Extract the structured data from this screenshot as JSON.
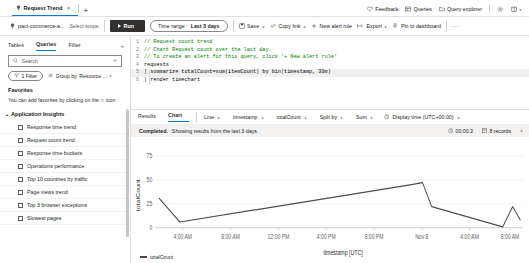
{
  "window": {
    "tab": {
      "title": "Request Trend",
      "close_label": "×",
      "new_tab_label": "+",
      "icon": "bulb-icon"
    }
  },
  "header": {
    "items": [
      {
        "label": "Feedback",
        "icon": "heart-icon"
      },
      {
        "label": "Queries",
        "icon": "queries-icon"
      },
      {
        "label": "Query explorer",
        "icon": "folder-icon"
      }
    ],
    "settings_icon": "gear-icon",
    "help_icon": "book-icon",
    "help_caret": "∨"
  },
  "command_bar": {
    "scope_resource": "pact-commerce-a...",
    "scope_select_label": "Select scope",
    "run_label": "Run",
    "time_range_prefix": "Time range :",
    "time_range_value": "Last 3 days",
    "save_label": "Save",
    "copy_link_label": "Copy link",
    "new_alert_rule_label": "New alert rule",
    "export_label": "Export",
    "pin_label": "Pin to dashboard",
    "overflow_label": "···",
    "caret": "∨"
  },
  "sidebar": {
    "tabs": [
      {
        "label": "Tables",
        "active": false
      },
      {
        "label": "Queries",
        "active": true
      },
      {
        "label": "Filter",
        "active": false
      }
    ],
    "collapse_icon": "«",
    "search": {
      "placeholder": "Search",
      "icon": "search-icon",
      "trailing_icon": "keyboard-icon"
    },
    "filter_pill": {
      "label": "1 Filter",
      "icon": "funnel-icon"
    },
    "group_by": {
      "label": "Group by: Resource ...",
      "icon": "list-icon",
      "caret": "∨"
    },
    "favorites": {
      "title": "Favorites",
      "description": "You can add favorites by clicking on the ☆ icon"
    },
    "group": {
      "name": "Application Insights",
      "chevron": "▴",
      "items": [
        {
          "label": "Response time trend"
        },
        {
          "label": "Request count trend"
        },
        {
          "label": "Response time buckets"
        },
        {
          "label": "Operations performance"
        },
        {
          "label": "Top 10 countries by traffic"
        },
        {
          "label": "Page views trend"
        },
        {
          "label": "Top 3 browser exceptions"
        },
        {
          "label": "Slowest pages"
        }
      ]
    }
  },
  "editor": {
    "lines": [
      {
        "num": "1",
        "text": "// Request count trend",
        "kind": "comment"
      },
      {
        "num": "2",
        "text": "// Chart Request count over the last day.",
        "kind": "comment"
      },
      {
        "num": "3",
        "text": "// To create an alert for this query, click '+ New alert rule'",
        "kind": "comment"
      },
      {
        "num": "4",
        "text": "requests",
        "kind": "table"
      },
      {
        "num": "5",
        "text": "| summarize totalCount=sum(itemCount) by bin(timestamp, 30m)",
        "kind": "code"
      },
      {
        "num": "6",
        "text": "| render timechart",
        "kind": "code"
      }
    ]
  },
  "results": {
    "tabs": [
      {
        "label": "Results",
        "active": false
      },
      {
        "label": "Chart",
        "active": true
      }
    ],
    "controls": [
      {
        "label": "Line",
        "name": "chart-type-select"
      },
      {
        "label": "timestamp",
        "name": "x-axis-select"
      },
      {
        "label": "totalCount",
        "name": "y-axis-select"
      },
      {
        "label": "Split by",
        "name": "split-by-select"
      },
      {
        "label": "Sum",
        "name": "aggregation-select"
      }
    ],
    "display_time": {
      "label": "Display time (UTC+00:00)",
      "icon": "clock-icon",
      "caret": "∨"
    },
    "caret": "∨"
  },
  "status": {
    "state": "Completed.",
    "message": "Showing results from the last 3 days.",
    "duration": "00:00.3",
    "duration_icon": "clock-icon",
    "records": "8 records",
    "records_icon": "table-icon",
    "caret": "∨"
  },
  "chart_data": {
    "type": "line",
    "title": "",
    "xlabel": "timestamp [UTC]",
    "ylabel": "totalCount",
    "legend": [
      {
        "name": "totalCount",
        "color": "#4a4a4a"
      }
    ],
    "legend_position": "bottom-left",
    "grid": true,
    "ylim": [
      0,
      82
    ],
    "yticks": [
      0,
      25,
      50,
      75
    ],
    "ytick_labels": [
      "0",
      "25",
      "50",
      "75"
    ],
    "xtick_labels": [
      "4:00 AM",
      "8:00 AM",
      "12:00 PM",
      "4:00 PM",
      "8:00 PM",
      "Nov 8",
      "4:00 AM",
      "8:00 AM"
    ],
    "xtick_positions": [
      0.075,
      0.205,
      0.335,
      0.465,
      0.595,
      0.725,
      0.855,
      0.965
    ],
    "series": [
      {
        "name": "totalCount",
        "color": "#4a4a4a",
        "points": [
          {
            "x": 0.01,
            "y": 31
          },
          {
            "x": 0.067,
            "y": 6
          },
          {
            "x": 0.697,
            "y": 45
          },
          {
            "x": 0.727,
            "y": 47
          },
          {
            "x": 0.752,
            "y": 22
          },
          {
            "x": 0.945,
            "y": 1
          },
          {
            "x": 0.972,
            "y": 22
          },
          {
            "x": 0.993,
            "y": 8
          }
        ]
      }
    ]
  }
}
